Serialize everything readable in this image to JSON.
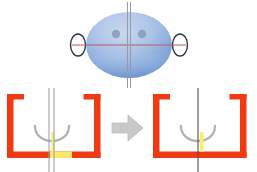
{
  "figure": {
    "background_color": "#ffffff",
    "width": 257,
    "height": 172
  },
  "colors": {
    "arch_orange": "#F03A14",
    "arch_orange_light": "#FF6A33",
    "head_blue_light": "#AFC6E9",
    "head_blue_mid": "#8FAFDF",
    "head_blue_dark": "#6E93CF",
    "eye_gray": "#8A9AB5",
    "ear_outline": "#2B3448",
    "midline_gray": "#9A9AA2",
    "midline_dark": "#5B4A52",
    "horizontal_red": "#C05A5A",
    "curve_gray": "#B4B4B8",
    "highlight_yellow": "#F7F06A",
    "highlight_yellow_soft": "#FAF6A8",
    "arrow_gray": "#C9C9C9",
    "arrow_gray_edge": "#BDBDBD"
  },
  "head_diagram": {
    "name": "head-top-view",
    "shape": "ellipse",
    "ears": [
      {
        "side": "left",
        "label": "ear-left"
      },
      {
        "side": "right",
        "label": "ear-right"
      }
    ],
    "eyes": [
      {
        "side": "left",
        "label": "eye-left"
      },
      {
        "side": "right",
        "label": "eye-right"
      }
    ],
    "reference_lines": [
      {
        "name": "vertical-midline",
        "orientation": "vertical",
        "color": "#9A9AA2"
      },
      {
        "name": "horizontal-interaural-line",
        "orientation": "horizontal",
        "color": "#C05A5A"
      }
    ]
  },
  "panels": [
    {
      "id": "before",
      "name": "dental-arch-before",
      "arch_color": "#F03A14",
      "midline_count": 2,
      "midline_color": "#9A9AA2",
      "midline_deviation": "offset",
      "curve_color": "#B4B4B8",
      "highlight_color": "#F7F06A",
      "bottom_bar_highlight": true,
      "highlight_width_ratio": 0.34
    },
    {
      "id": "after",
      "name": "dental-arch-after",
      "arch_color": "#F03A14",
      "midline_count": 1,
      "midline_color": "#5B4A52",
      "midline_deviation": "aligned",
      "curve_color": "#B4B4B8",
      "highlight_color": "#F7F06A",
      "bottom_bar_highlight": false,
      "highlight_width_ratio": 0.0
    }
  ],
  "transition": {
    "name": "transition-arrow",
    "direction": "right",
    "color": "#C9C9C9"
  }
}
